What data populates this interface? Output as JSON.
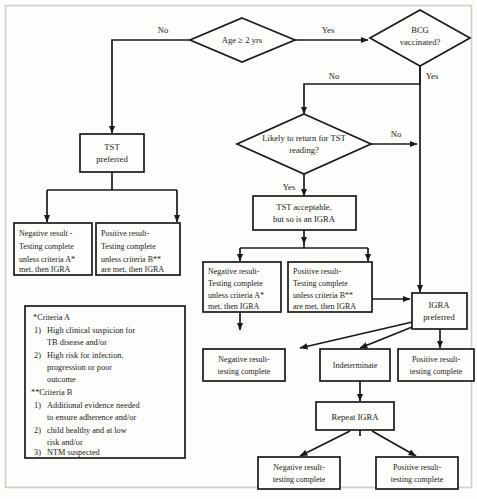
{
  "figure": {
    "background_color": "#fdfdfb",
    "line_color": "#1a1a1a",
    "frame_color": "#cfcfc8"
  },
  "decisions": [
    {
      "id": "age",
      "text_line1": "Age ≥ 2 yrs",
      "text_line2": ""
    },
    {
      "id": "bcg",
      "text_line1": "BCG",
      "text_line2": "vaccinated?"
    },
    {
      "id": "tstr",
      "text_line1": "Likely to return for TST",
      "text_line2": "reading?"
    }
  ],
  "boxes": [
    {
      "id": "tst_preferred",
      "lines": [
        "TST",
        "preferred"
      ]
    },
    {
      "id": "tst_neg_left",
      "lines": [
        "Negative result -",
        "Testing complete",
        "unless criteria A*",
        "met, then IGRA"
      ]
    },
    {
      "id": "tst_pos_left",
      "lines": [
        "Positive result-",
        "Testing complete",
        "unless criteria B**",
        "are met, then IGRA"
      ]
    },
    {
      "id": "tst_acceptable",
      "lines": [
        "TST acceptable,",
        "but so is an IGRA"
      ]
    },
    {
      "id": "tst_neg_mid",
      "lines": [
        "Negative result-",
        "Testing complete",
        "unless criteria A*",
        "met, then IGRA"
      ]
    },
    {
      "id": "tst_pos_mid",
      "lines": [
        "Positive result-",
        "Testing complete",
        "unless criteria B**",
        "are met, then IGRA"
      ]
    },
    {
      "id": "igra_preferred",
      "lines": [
        "IGRA",
        "preferred"
      ]
    },
    {
      "id": "igra_negative",
      "lines": [
        "Negative result-",
        "testing complete"
      ]
    },
    {
      "id": "igra_indet",
      "lines": [
        "Indeterminate"
      ]
    },
    {
      "id": "igra_positive",
      "lines": [
        "Positive result-",
        "testing complete"
      ]
    },
    {
      "id": "repeat_igra",
      "lines": [
        "Repeat IGRA"
      ]
    },
    {
      "id": "repeat_neg",
      "lines": [
        "Negative result-",
        "testing complete"
      ]
    },
    {
      "id": "repeat_pos",
      "lines": [
        "Positive result-",
        "testing complete"
      ]
    }
  ],
  "edge_labels": [
    {
      "id": "age_no",
      "text": "No"
    },
    {
      "id": "age_yes",
      "text": "Yes"
    },
    {
      "id": "bcg_no",
      "text": "No"
    },
    {
      "id": "bcg_yes",
      "text": "Yes"
    },
    {
      "id": "tstr_no",
      "text": "No"
    },
    {
      "id": "tstr_yes",
      "text": "Yes"
    }
  ],
  "legend": {
    "criteria_a_heading": "*Criteria A",
    "criteria_a_items": [
      {
        "num": "1)",
        "lines": [
          "High clinical suspicion for",
          "TB disease and/or"
        ]
      },
      {
        "num": "2)",
        "lines": [
          "High risk for infection,",
          "progression or poor",
          "outcome"
        ]
      }
    ],
    "criteria_b_heading": "**Criteria B",
    "criteria_b_items": [
      {
        "num": "1)",
        "lines": [
          "Additional evidence needed",
          "to ensure adherence and/or"
        ]
      },
      {
        "num": "2)",
        "lines": [
          "child healthy and at low",
          "risk and/or"
        ]
      },
      {
        "num": "3)",
        "lines": [
          "NTM suspected"
        ]
      }
    ]
  }
}
